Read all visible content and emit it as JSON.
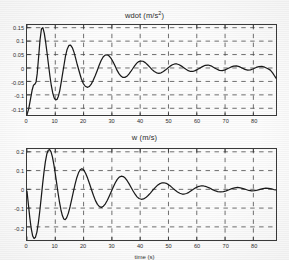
{
  "figure": {
    "background_color": "#fdfdfd",
    "axis_color": "#3a3a3a",
    "grid_color": "#4a4a4a",
    "line_color": "#1a1a1a"
  },
  "chart_data": [
    {
      "type": "line",
      "id": "wdot",
      "title": "wdot (m/s²)",
      "title_base": "wdot (m/s",
      "title_sup": "2",
      "title_tail": ")",
      "xlabel": "",
      "ylabel": "",
      "xlim": [
        0,
        88
      ],
      "ylim": [
        -0.175,
        0.16
      ],
      "xticks": [
        0,
        10,
        20,
        30,
        40,
        50,
        60,
        70,
        80
      ],
      "xtick_labels": [
        "0",
        "10",
        "20",
        "30",
        "40",
        "50",
        "60",
        "70",
        "80"
      ],
      "yticks": [
        0.15,
        0.1,
        0.05,
        0,
        -0.05,
        -0.1,
        -0.15
      ],
      "ytick_labels": [
        "0.15",
        "0.1",
        "0.05",
        "0",
        "-0.05",
        "-0.1",
        "-0.15"
      ],
      "grid": true,
      "grid_style": "dashed",
      "legend": null,
      "series": [
        {
          "name": "wdot",
          "x": [
            0,
            0.6,
            1.2,
            1.8,
            2.3,
            2.8,
            3.2,
            3.6,
            4.1,
            4.6,
            5.1,
            5.6,
            6.1,
            6.6,
            7.1,
            7.6,
            8.1,
            8.6,
            9.1,
            9.6,
            10.1,
            10.6,
            11.1,
            11.6,
            12.1,
            12.6,
            13.1,
            13.6,
            14.2,
            14.8,
            15.4,
            16.0,
            16.6,
            17.2,
            17.8,
            18.5,
            19.2,
            19.9,
            20.6,
            21.3,
            22.0,
            22.7,
            23.4,
            24.1,
            24.8,
            25.5,
            26.2,
            26.9,
            27.6,
            28.3,
            29.0,
            29.7,
            30.4,
            31.1,
            31.8,
            32.5,
            33.2,
            33.9,
            34.6,
            35.3,
            36.0,
            36.7,
            37.4,
            38.1,
            38.8,
            39.5,
            40.2,
            41.0,
            41.8,
            42.6,
            43.4,
            44.2,
            45.0,
            45.8,
            46.6,
            47.4,
            48.2,
            49.0,
            49.8,
            50.6,
            51.4,
            52.2,
            53.0,
            53.8,
            54.6,
            55.4,
            56.2,
            57.0,
            57.8,
            58.6,
            59.4,
            60.2,
            61.0,
            62.0,
            63.0,
            64.0,
            65.0,
            66.0,
            67.0,
            68.0,
            69.0,
            70.0,
            71.0,
            72.0,
            73.0,
            74.0,
            75.0,
            76.0,
            77.0,
            78.0,
            79.0,
            80.0,
            81.0,
            82.0,
            83.0,
            84.0,
            85.0,
            86.0,
            86.8,
            87.4,
            88.0
          ],
          "y": [
            -0.173,
            -0.152,
            -0.118,
            -0.083,
            -0.064,
            -0.06,
            -0.052,
            -0.022,
            0.04,
            0.104,
            0.145,
            0.15,
            0.13,
            0.095,
            0.055,
            0.012,
            -0.03,
            -0.066,
            -0.093,
            -0.111,
            -0.119,
            -0.117,
            -0.105,
            -0.083,
            -0.053,
            -0.02,
            0.012,
            0.044,
            0.07,
            0.084,
            0.085,
            0.076,
            0.059,
            0.036,
            0.011,
            -0.015,
            -0.04,
            -0.058,
            -0.068,
            -0.072,
            -0.069,
            -0.06,
            -0.046,
            -0.029,
            -0.01,
            0.01,
            0.028,
            0.041,
            0.048,
            0.049,
            0.045,
            0.036,
            0.023,
            0.008,
            -0.008,
            -0.021,
            -0.03,
            -0.035,
            -0.035,
            -0.031,
            -0.023,
            -0.013,
            -0.002,
            0.009,
            0.018,
            0.024,
            0.026,
            0.025,
            0.02,
            0.012,
            0.003,
            -0.006,
            -0.013,
            -0.018,
            -0.02,
            -0.018,
            -0.013,
            -0.007,
            0.0,
            0.007,
            0.012,
            0.015,
            0.015,
            0.012,
            0.007,
            0.001,
            -0.005,
            -0.01,
            -0.013,
            -0.013,
            -0.01,
            -0.006,
            -0.001,
            0.005,
            0.01,
            0.011,
            0.008,
            0.002,
            -0.004,
            -0.009,
            -0.01,
            -0.007,
            -0.002,
            0.003,
            0.007,
            0.008,
            0.005,
            0.0,
            -0.005,
            -0.008,
            -0.007,
            -0.003,
            0.002,
            0.005,
            0.006,
            0.003,
            -0.002,
            -0.008,
            -0.018,
            -0.028,
            -0.038
          ]
        }
      ]
    },
    {
      "type": "line",
      "id": "w",
      "title": "w (m/s)",
      "xlabel": "time (s)",
      "ylabel": "",
      "xlim": [
        0,
        88
      ],
      "ylim": [
        -0.27,
        0.215
      ],
      "xticks": [
        0,
        10,
        20,
        30,
        40,
        50,
        60,
        70,
        80
      ],
      "xtick_labels": [
        "0",
        "10",
        "20",
        "30",
        "40",
        "50",
        "60",
        "70",
        "80"
      ],
      "yticks": [
        0.2,
        0.1,
        0,
        -0.1,
        -0.2
      ],
      "ytick_labels": [
        "0.2",
        "0.1",
        "0",
        "-0.1",
        "-0.2"
      ],
      "grid": true,
      "grid_style": "dashed",
      "legend": null,
      "series": [
        {
          "name": "w",
          "x": [
            0,
            0.5,
            1.0,
            1.5,
            2.0,
            2.5,
            3.0,
            3.5,
            4.0,
            4.5,
            5.0,
            5.5,
            6.0,
            6.5,
            7.0,
            7.5,
            8.0,
            8.5,
            9.0,
            9.5,
            10.0,
            10.5,
            11.0,
            11.5,
            12.0,
            12.5,
            13.0,
            13.5,
            14.0,
            14.6,
            15.2,
            15.8,
            16.4,
            17.0,
            17.6,
            18.2,
            18.8,
            19.4,
            20.0,
            20.7,
            21.4,
            22.1,
            22.8,
            23.5,
            24.2,
            24.9,
            25.6,
            26.3,
            27.0,
            27.7,
            28.4,
            29.1,
            29.8,
            30.5,
            31.2,
            31.9,
            32.6,
            33.3,
            34.0,
            34.7,
            35.4,
            36.1,
            36.8,
            37.5,
            38.2,
            38.9,
            39.6,
            40.4,
            41.2,
            42.0,
            42.8,
            43.6,
            44.4,
            45.2,
            46.0,
            46.8,
            47.6,
            48.4,
            49.2,
            50.0,
            50.8,
            51.6,
            52.4,
            53.2,
            54.0,
            54.8,
            55.6,
            56.4,
            57.2,
            58.0,
            58.8,
            59.6,
            60.4,
            61.4,
            62.4,
            63.4,
            64.4,
            65.4,
            66.4,
            67.4,
            68.4,
            69.4,
            70.4,
            71.4,
            72.4,
            73.4,
            74.4,
            75.4,
            76.4,
            77.4,
            78.4,
            79.4,
            80.4,
            81.4,
            82.4,
            83.4,
            84.4,
            85.4,
            86.4,
            87.2,
            88.0
          ],
          "y": [
            -0.01,
            -0.082,
            -0.152,
            -0.21,
            -0.248,
            -0.262,
            -0.255,
            -0.228,
            -0.18,
            -0.118,
            -0.048,
            0.025,
            0.092,
            0.148,
            0.188,
            0.208,
            0.212,
            0.2,
            0.172,
            0.132,
            0.082,
            0.03,
            -0.022,
            -0.07,
            -0.11,
            -0.14,
            -0.158,
            -0.162,
            -0.152,
            -0.128,
            -0.094,
            -0.054,
            -0.012,
            0.028,
            0.062,
            0.088,
            0.104,
            0.11,
            0.104,
            0.086,
            0.06,
            0.03,
            -0.002,
            -0.033,
            -0.06,
            -0.08,
            -0.092,
            -0.096,
            -0.09,
            -0.077,
            -0.058,
            -0.035,
            -0.011,
            0.013,
            0.035,
            0.053,
            0.065,
            0.07,
            0.068,
            0.06,
            0.046,
            0.029,
            0.01,
            -0.009,
            -0.026,
            -0.04,
            -0.049,
            -0.053,
            -0.051,
            -0.044,
            -0.033,
            -0.02,
            -0.006,
            0.008,
            0.02,
            0.029,
            0.034,
            0.035,
            0.032,
            0.025,
            0.016,
            0.005,
            -0.005,
            -0.014,
            -0.021,
            -0.025,
            -0.025,
            -0.022,
            -0.016,
            -0.008,
            0.0,
            0.008,
            0.014,
            0.018,
            0.018,
            0.014,
            0.008,
            0.0,
            -0.007,
            -0.012,
            -0.014,
            -0.012,
            -0.008,
            -0.002,
            0.004,
            0.008,
            0.01,
            0.008,
            0.004,
            -0.001,
            -0.006,
            -0.008,
            -0.007,
            -0.004,
            0.0,
            0.004,
            0.006,
            0.005,
            0.002,
            -0.001,
            -0.003,
            -0.004
          ]
        }
      ]
    }
  ]
}
